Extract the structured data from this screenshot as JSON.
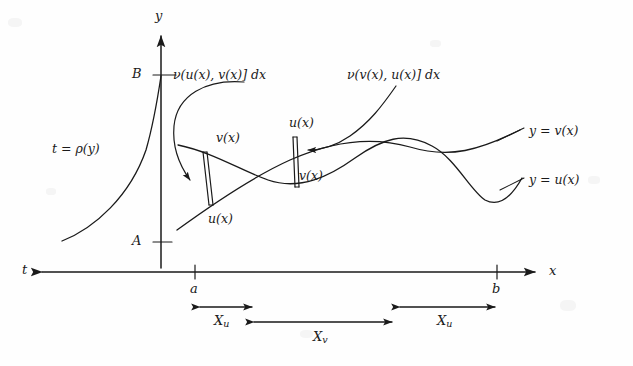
{
  "figure": {
    "type": "mathematical-diagram",
    "axes": {
      "y_axis_label": "y",
      "x_axis_label": "x",
      "t_axis_label": "t",
      "tick_B": "B",
      "tick_A": "A",
      "tick_a": "a",
      "tick_b": "b"
    },
    "curves": {
      "rho_label": "t = ρ(y)",
      "upper_curve_label": "y = v(x)",
      "lower_curve_label": "y = u(x)"
    },
    "callouts": {
      "left": "ν(u(x), v(x)] dx",
      "right": "ν(v(x), u(x)] dx"
    },
    "strips": {
      "left_top": "v(x)",
      "left_bottom": "u(x)",
      "right_top": "u(x)",
      "right_bottom": "v(x)"
    },
    "braces": {
      "left_Xu": "X",
      "left_Xu_sub": "u",
      "middle_Xv": "X",
      "middle_Xv_sub": "v",
      "right_Xu": "X",
      "right_Xu_sub": "u"
    },
    "colors": {
      "ink": "#1a1a1a",
      "background": "#fefefe"
    }
  }
}
